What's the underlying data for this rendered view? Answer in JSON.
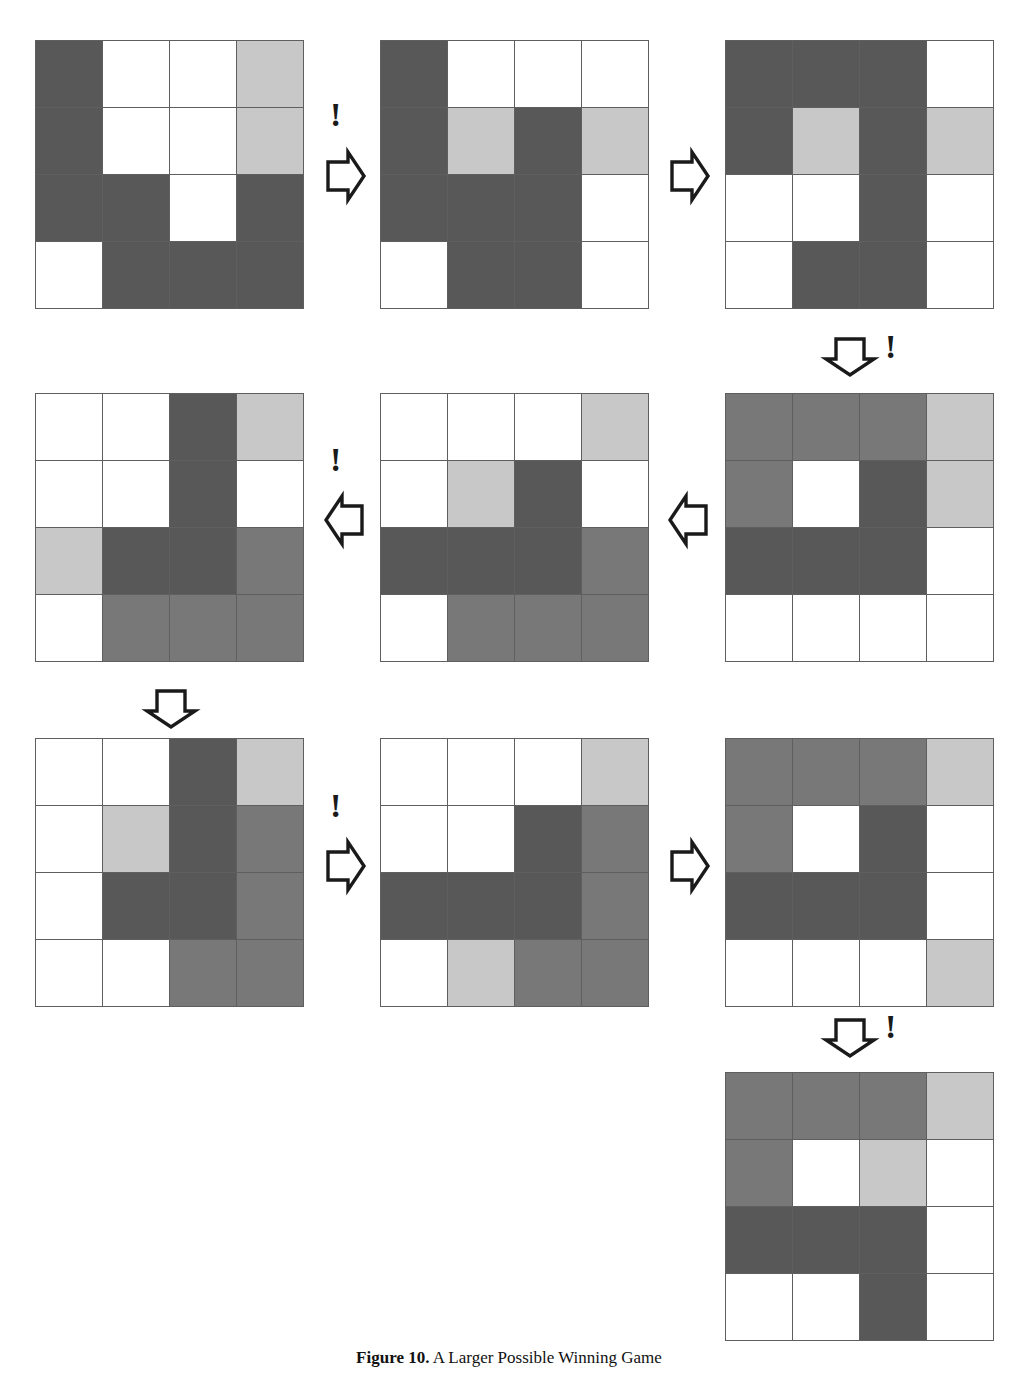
{
  "figure": {
    "caption_label": "Figure 10.",
    "caption_text": "A Larger Possible Winning Game",
    "palette": {
      "white": "#ffffff",
      "light_gray": "#c8c8c8",
      "medium_gray": "#787878",
      "dark_gray": "#585858",
      "grid_line": "#5f5f5f"
    },
    "grid_size": "4x4",
    "legend": {
      "white": "empty",
      "light_gray": "light piece",
      "medium_gray": "medium piece",
      "dark_gray": "dark piece"
    }
  },
  "boards": [
    {
      "id": "board-1",
      "step": 1,
      "position": "row1-col1",
      "cells": [
        [
          "dark",
          "white",
          "white",
          "light"
        ],
        [
          "dark",
          "white",
          "white",
          "light"
        ],
        [
          "dark",
          "dark",
          "white",
          "dark"
        ],
        [
          "white",
          "dark",
          "dark",
          "dark"
        ]
      ]
    },
    {
      "id": "board-2",
      "step": 2,
      "position": "row1-col2",
      "cells": [
        [
          "dark",
          "white",
          "white",
          "white"
        ],
        [
          "dark",
          "light",
          "dark",
          "light"
        ],
        [
          "dark",
          "dark",
          "dark",
          "white"
        ],
        [
          "white",
          "dark",
          "dark",
          "white"
        ]
      ]
    },
    {
      "id": "board-3",
      "step": 3,
      "position": "row1-col3",
      "cells": [
        [
          "dark",
          "dark",
          "dark",
          "white"
        ],
        [
          "dark",
          "light",
          "dark",
          "light"
        ],
        [
          "white",
          "white",
          "dark",
          "white"
        ],
        [
          "white",
          "dark",
          "dark",
          "white"
        ]
      ]
    },
    {
      "id": "board-4",
      "step": 4,
      "position": "row2-col3",
      "cells": [
        [
          "medium",
          "medium",
          "medium",
          "light"
        ],
        [
          "medium",
          "white",
          "dark",
          "light"
        ],
        [
          "dark",
          "dark",
          "dark",
          "white"
        ],
        [
          "white",
          "white",
          "white",
          "white"
        ]
      ]
    },
    {
      "id": "board-5",
      "step": 5,
      "position": "row2-col2",
      "cells": [
        [
          "white",
          "white",
          "white",
          "light"
        ],
        [
          "white",
          "light",
          "dark",
          "white"
        ],
        [
          "dark",
          "dark",
          "dark",
          "medium"
        ],
        [
          "white",
          "medium",
          "medium",
          "medium"
        ]
      ]
    },
    {
      "id": "board-6",
      "step": 6,
      "position": "row2-col1",
      "cells": [
        [
          "white",
          "white",
          "dark",
          "light"
        ],
        [
          "white",
          "white",
          "dark",
          "white"
        ],
        [
          "light",
          "dark",
          "dark",
          "medium"
        ],
        [
          "white",
          "medium",
          "medium",
          "medium"
        ]
      ]
    },
    {
      "id": "board-7",
      "step": 7,
      "position": "row3-col1",
      "cells": [
        [
          "white",
          "white",
          "dark",
          "light"
        ],
        [
          "white",
          "light",
          "dark",
          "medium"
        ],
        [
          "white",
          "dark",
          "dark",
          "medium"
        ],
        [
          "white",
          "white",
          "medium",
          "medium"
        ]
      ]
    },
    {
      "id": "board-8",
      "step": 8,
      "position": "row3-col2",
      "cells": [
        [
          "white",
          "white",
          "white",
          "light"
        ],
        [
          "white",
          "white",
          "dark",
          "medium"
        ],
        [
          "dark",
          "dark",
          "dark",
          "medium"
        ],
        [
          "white",
          "light",
          "medium",
          "medium"
        ]
      ]
    },
    {
      "id": "board-9",
      "step": 9,
      "position": "row3-col3",
      "cells": [
        [
          "medium",
          "medium",
          "medium",
          "light"
        ],
        [
          "medium",
          "white",
          "dark",
          "white"
        ],
        [
          "dark",
          "dark",
          "dark",
          "white"
        ],
        [
          "white",
          "white",
          "white",
          "light"
        ]
      ]
    },
    {
      "id": "board-10",
      "step": 10,
      "position": "row4-col3",
      "cells": [
        [
          "medium",
          "medium",
          "medium",
          "light"
        ],
        [
          "medium",
          "white",
          "light",
          "white"
        ],
        [
          "dark",
          "dark",
          "dark",
          "white"
        ],
        [
          "white",
          "white",
          "dark",
          "white"
        ]
      ]
    }
  ],
  "arrows": [
    {
      "id": "arrow-1",
      "direction": "right",
      "bang": "!",
      "from": "board-1",
      "to": "board-2"
    },
    {
      "id": "arrow-2",
      "direction": "right",
      "bang": "",
      "from": "board-2",
      "to": "board-3"
    },
    {
      "id": "arrow-3",
      "direction": "down",
      "bang": "!",
      "from": "board-3",
      "to": "board-4"
    },
    {
      "id": "arrow-4",
      "direction": "left",
      "bang": "",
      "from": "board-4",
      "to": "board-5"
    },
    {
      "id": "arrow-5",
      "direction": "left",
      "bang": "!",
      "from": "board-5",
      "to": "board-6"
    },
    {
      "id": "arrow-6",
      "direction": "down",
      "bang": "",
      "from": "board-6",
      "to": "board-7"
    },
    {
      "id": "arrow-7",
      "direction": "right",
      "bang": "!",
      "from": "board-7",
      "to": "board-8"
    },
    {
      "id": "arrow-8",
      "direction": "right",
      "bang": "",
      "from": "board-8",
      "to": "board-9"
    },
    {
      "id": "arrow-9",
      "direction": "down",
      "bang": "!",
      "from": "board-9",
      "to": "board-10"
    }
  ]
}
